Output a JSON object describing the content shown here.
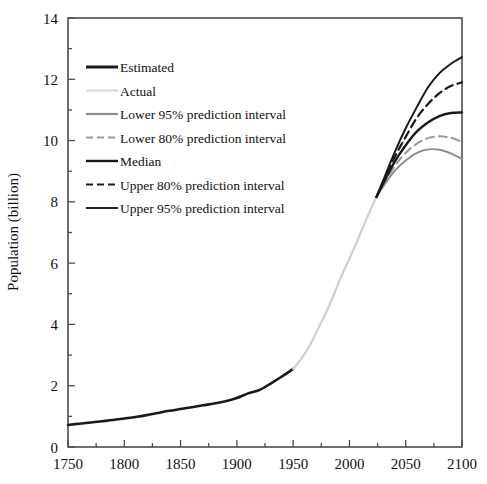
{
  "chart_data": {
    "type": "line",
    "title": "",
    "xlabel": "",
    "ylabel": "Population (billion)",
    "xlim": [
      1750,
      2100
    ],
    "ylim": [
      0,
      14
    ],
    "xticks": [
      1750,
      1800,
      1850,
      1900,
      1950,
      2000,
      2050,
      2100
    ],
    "xtick_labels": [
      "1750",
      "1800",
      "1850",
      "1900",
      "1950",
      "2000",
      "2050",
      "2100"
    ],
    "x_minor_step": 25,
    "yticks": [
      0,
      2,
      4,
      6,
      8,
      10,
      12,
      14
    ],
    "ytick_labels": [
      "0",
      "2",
      "4",
      "6",
      "8",
      "10",
      "12",
      "14"
    ],
    "y_minor_step": 1,
    "grid": false,
    "legend_position": "upper-left-inside",
    "series": [
      {
        "name": "Estimated",
        "color": "#1a1a1a",
        "width": 2.6,
        "dash": "none",
        "x": [
          1750,
          1760,
          1770,
          1780,
          1790,
          1800,
          1810,
          1820,
          1830,
          1840,
          1850,
          1860,
          1870,
          1880,
          1890,
          1900,
          1910,
          1920,
          1930,
          1940,
          1950
        ],
        "values": [
          0.72,
          0.76,
          0.8,
          0.84,
          0.88,
          0.93,
          0.98,
          1.04,
          1.11,
          1.18,
          1.24,
          1.3,
          1.36,
          1.42,
          1.49,
          1.6,
          1.75,
          1.86,
          2.07,
          2.3,
          2.55
        ]
      },
      {
        "name": "Actual",
        "color": "#cfcfcf",
        "width": 2.2,
        "dash": "none",
        "x": [
          1950,
          1955,
          1960,
          1965,
          1970,
          1975,
          1980,
          1985,
          1990,
          1995,
          2000,
          2005,
          2010,
          2015,
          2020,
          2024
        ],
        "values": [
          2.55,
          2.77,
          3.03,
          3.33,
          3.7,
          4.07,
          4.44,
          4.87,
          5.33,
          5.75,
          6.15,
          6.56,
          6.99,
          7.43,
          7.84,
          8.16
        ]
      },
      {
        "name": "Lower 95% prediction interval",
        "color": "#8c8c8c",
        "width": 1.8,
        "dash": "none",
        "x": [
          2024,
          2030,
          2040,
          2050,
          2060,
          2070,
          2080,
          2090,
          2100
        ],
        "values": [
          8.16,
          8.5,
          9.0,
          9.35,
          9.6,
          9.71,
          9.7,
          9.58,
          9.4
        ]
      },
      {
        "name": "Lower 80% prediction interval",
        "color": "#9a9a9a",
        "width": 2.0,
        "dash": "8 5",
        "x": [
          2024,
          2030,
          2040,
          2050,
          2060,
          2070,
          2080,
          2090,
          2100
        ],
        "values": [
          8.16,
          8.55,
          9.15,
          9.6,
          9.9,
          10.08,
          10.14,
          10.09,
          9.96
        ]
      },
      {
        "name": "Median",
        "color": "#1a1a1a",
        "width": 2.4,
        "dash": "none",
        "x": [
          2024,
          2030,
          2040,
          2050,
          2060,
          2070,
          2080,
          2090,
          2100
        ],
        "values": [
          8.16,
          8.6,
          9.3,
          9.85,
          10.3,
          10.6,
          10.8,
          10.9,
          10.92
        ]
      },
      {
        "name": "Upper 80% prediction interval",
        "color": "#1a1a1a",
        "width": 2.2,
        "dash": "8 5",
        "x": [
          2024,
          2030,
          2040,
          2050,
          2060,
          2070,
          2080,
          2090,
          2100
        ],
        "values": [
          8.16,
          8.65,
          9.45,
          10.12,
          10.75,
          11.2,
          11.55,
          11.78,
          11.9
        ]
      },
      {
        "name": "Upper 95% prediction interval",
        "color": "#1a1a1a",
        "width": 2.0,
        "dash": "none",
        "x": [
          2024,
          2030,
          2040,
          2050,
          2060,
          2070,
          2080,
          2090,
          2100
        ],
        "values": [
          8.16,
          8.7,
          9.6,
          10.4,
          11.1,
          11.75,
          12.2,
          12.5,
          12.72
        ]
      }
    ],
    "legend": [
      {
        "label": "Estimated",
        "color": "#1a1a1a",
        "width": 3.0,
        "dash": "none"
      },
      {
        "label": "Actual",
        "color": "#d4d4d4",
        "width": 2.0,
        "dash": "none"
      },
      {
        "label": "Lower 95% prediction interval",
        "color": "#8c8c8c",
        "width": 2.2,
        "dash": "none"
      },
      {
        "label": "Lower 80% prediction interval",
        "color": "#9a9a9a",
        "width": 2.0,
        "dash": "7 4"
      },
      {
        "label": "Median",
        "color": "#1a1a1a",
        "width": 2.4,
        "dash": "none"
      },
      {
        "label": "Upper 80% prediction interval",
        "color": "#1a1a1a",
        "width": 2.2,
        "dash": "7 4"
      },
      {
        "label": "Upper 95% prediction interval",
        "color": "#1a1a1a",
        "width": 1.9,
        "dash": "none"
      }
    ]
  },
  "axes": {
    "y_axis_title": "Population (billion)",
    "frame_color": "#4d4d4d"
  }
}
